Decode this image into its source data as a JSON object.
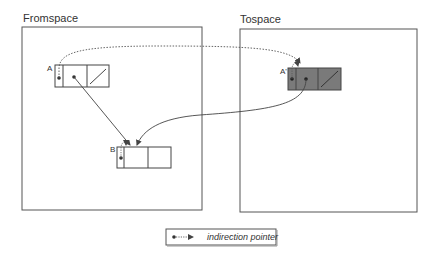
{
  "diagram": {
    "spaces": [
      {
        "id": "fromspace",
        "label": "Fromspace"
      },
      {
        "id": "tospace",
        "label": "Tospace"
      }
    ],
    "objects": [
      {
        "id": "A",
        "label": "A",
        "space": "fromspace",
        "fill": "#ffffff"
      },
      {
        "id": "B",
        "label": "B",
        "space": "fromspace",
        "fill": "#ffffff"
      },
      {
        "id": "A_prime",
        "label": "A'",
        "space": "tospace",
        "fill": "#7a7a7a"
      }
    ],
    "edges": [
      {
        "from": "A.header",
        "to": "A_prime",
        "style": "dotted",
        "kind": "indirection pointer"
      },
      {
        "from": "A.field1",
        "to": "B",
        "style": "solid",
        "kind": "pointer"
      },
      {
        "from": "A_prime.field1",
        "to": "B",
        "style": "solid",
        "kind": "pointer"
      },
      {
        "from": "B.header",
        "to": "B",
        "style": "dotted",
        "kind": "indirection pointer"
      },
      {
        "from": "A_prime.header",
        "to": "A_prime",
        "style": "dotted",
        "kind": "indirection pointer"
      }
    ],
    "legend": {
      "label": "indirection pointer"
    },
    "colors": {
      "line": "#444444",
      "tospace_object_fill": "#7a7a7a"
    }
  }
}
